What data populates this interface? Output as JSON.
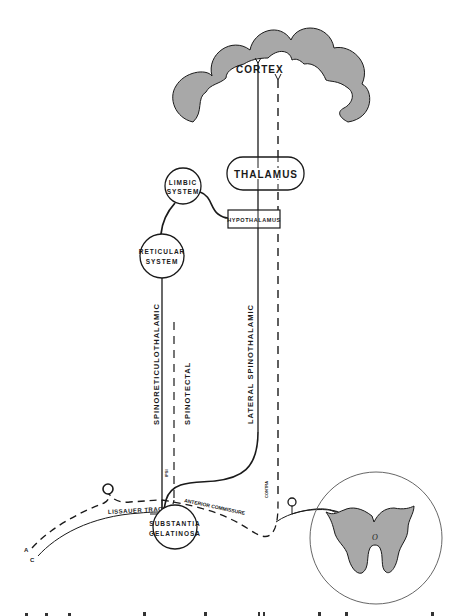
{
  "figure": {
    "type": "neuroanatomy pathway diagram",
    "colors": {
      "line": "#1a1a1a",
      "shaded": "#a8a8a8",
      "background": "#ffffff"
    },
    "structures": {
      "cortex": "CORTEX",
      "thalamus": "THALAMUS",
      "limbic_line1": "LIMBIC",
      "limbic_line2": "SYSTEM",
      "hypothalamus": "HYPOTHALAMUS",
      "reticular_line1": "RETICULAR",
      "reticular_line2": "SYSTEM",
      "substantia_line1": "SUBSTANTIA",
      "substantia_line2": "GELATINOSA",
      "spinal_cord_label": "O"
    },
    "tracts": {
      "spinoreticulothalamic": "SPINORETICULOTHALAMIC",
      "spinotectal": "SPINOTECTAL",
      "lateral_spinothalamic": "LATERAL SPINOTHALAMIC",
      "lissauer": "LISSAUER TRACT",
      "anterior_commissure": "ANTERIOR COMMISSURE",
      "ipsi": "IPSI",
      "contra": "CONTRA"
    },
    "fibers": {
      "a": "A",
      "c": "C"
    }
  }
}
